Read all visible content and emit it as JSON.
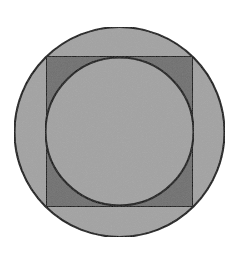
{
  "diagram": {
    "canvas": {
      "width": 236,
      "height": 254,
      "background": "#ffffff"
    },
    "outer_circle": {
      "cx": 119.5,
      "cy": 132,
      "r": 105,
      "fill": "#a3a3a3",
      "stroke": "#111111"
    },
    "square": {
      "x": 46,
      "y": 56,
      "width": 147,
      "height": 151,
      "fill": "#707070",
      "stroke": "#111111"
    },
    "inner_circle": {
      "cx": 119.5,
      "cy": 131.5,
      "r": 74,
      "fill": "#a3a3a3",
      "stroke": "#111111"
    },
    "stroke_width": 2
  }
}
